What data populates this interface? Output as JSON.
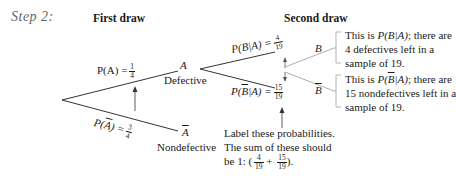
{
  "step_label": "Step 2:",
  "headers": {
    "first_draw": "First draw",
    "second_draw": "Second draw"
  },
  "first_draw": {
    "upper_branch": {
      "prob_prefix": "P(A) =",
      "numerator": "1",
      "denominator": "4",
      "node": "A",
      "node_caption": "Defective"
    },
    "lower_branch": {
      "prob_prefix_p": "P(",
      "prob_prefix_var": "A",
      "prob_prefix_suffix": ") =",
      "numerator": "3",
      "denominator": "4",
      "node": "A",
      "node_caption": "Nondefective"
    }
  },
  "second_draw": {
    "upper_branch": {
      "prob_prefix": "P(B|A) =",
      "numerator": "4",
      "denominator": "19",
      "node": "B"
    },
    "lower_branch": {
      "prob_p": "P(",
      "prob_var": "B",
      "prob_suffix": "|A) =",
      "numerator": "15",
      "denominator": "19",
      "node": "B"
    }
  },
  "callouts": {
    "upper": {
      "line1_pre": "This is ",
      "line1_math": "P(B|A)",
      "line1_post": "; there are",
      "line2": "4 defectives left in a",
      "line3": "sample of 19."
    },
    "lower": {
      "line1_pre": "This is ",
      "line1_math_p": "P(",
      "line1_math_var": "B",
      "line1_math_rest": "|A)",
      "line1_post": "; there are",
      "line2": "15 nondefectives left in a",
      "line3": "sample of 19."
    },
    "bottom": {
      "line1": "Label these probabilities.",
      "line2": "The sum of these should",
      "line3_pre": "be 1: (",
      "frac1_num": "4",
      "frac1_den": "19",
      "plus": "+",
      "frac2_num": "15",
      "frac2_den": "19",
      "line3_post": ")."
    }
  },
  "colors": {
    "line": "#333333",
    "connector": "#999999",
    "step_label": "#666666"
  }
}
